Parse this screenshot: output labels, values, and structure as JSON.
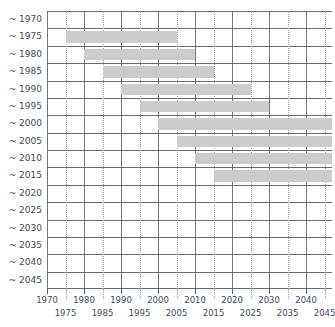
{
  "chart_data": {
    "type": "bar",
    "orientation": "horizontal",
    "subtype": "gantt-range",
    "title": "",
    "subtitle": "",
    "xlabel": "",
    "ylabel": "",
    "xlim": [
      1970,
      2047
    ],
    "grid": true,
    "legend": false,
    "bar_color": "#cccccc",
    "grid_color": "#555f66",
    "minor_grid_color": "#9aa3ab",
    "text_color": "#3f4c5a",
    "categories": [
      "~ 1970",
      "~ 1975",
      "~ 1980",
      "~ 1985",
      "~ 1990",
      "~ 1995",
      "~ 2000",
      "~ 2005",
      "~ 2010",
      "~ 2015",
      "~ 2020",
      "~ 2025",
      "~ 2030",
      "~ 2035",
      "~ 2040",
      "~ 2045"
    ],
    "x_ticks_major": [
      1970,
      1980,
      1990,
      2000,
      2010,
      2020,
      2030,
      2040
    ],
    "x_ticks_minor": [
      1975,
      1985,
      1995,
      2005,
      2015,
      2025,
      2035,
      2045
    ],
    "x_tick_labels_top": [
      "1970",
      "1980",
      "1990",
      "2000",
      "2010",
      "2020",
      "2030",
      "2040"
    ],
    "x_tick_labels_bottom": [
      "1975",
      "1985",
      "1995",
      "2005",
      "2015",
      "2025",
      "2035",
      "2045"
    ],
    "bars": [
      {
        "category": "~ 1970",
        "start": null,
        "end": null,
        "open_ended": false
      },
      {
        "category": "~ 1975",
        "start": 1975,
        "end": 2005,
        "open_ended": false
      },
      {
        "category": "~ 1980",
        "start": 1980,
        "end": 2010,
        "open_ended": false
      },
      {
        "category": "~ 1985",
        "start": 1985,
        "end": 2015,
        "open_ended": false
      },
      {
        "category": "~ 1990",
        "start": 1990,
        "end": 2025,
        "open_ended": false
      },
      {
        "category": "~ 1995",
        "start": 1995,
        "end": 2030,
        "open_ended": false
      },
      {
        "category": "~ 2000",
        "start": 2000,
        "end": 2047,
        "open_ended": true
      },
      {
        "category": "~ 2005",
        "start": 2005,
        "end": 2047,
        "open_ended": true
      },
      {
        "category": "~ 2010",
        "start": 2010,
        "end": 2047,
        "open_ended": true
      },
      {
        "category": "~ 2015",
        "start": 2015,
        "end": 2047,
        "open_ended": true
      },
      {
        "category": "~ 2020",
        "start": null,
        "end": null,
        "open_ended": false
      },
      {
        "category": "~ 2025",
        "start": null,
        "end": null,
        "open_ended": false
      },
      {
        "category": "~ 2030",
        "start": null,
        "end": null,
        "open_ended": false
      },
      {
        "category": "~ 2035",
        "start": null,
        "end": null,
        "open_ended": false
      },
      {
        "category": "~ 2040",
        "start": null,
        "end": null,
        "open_ended": false
      },
      {
        "category": "~ 2045",
        "start": null,
        "end": null,
        "open_ended": false
      }
    ]
  },
  "layout": {
    "plot_left": 47,
    "plot_top": 11,
    "plot_width": 285,
    "plot_height": 278,
    "row_height": 17.375
  }
}
